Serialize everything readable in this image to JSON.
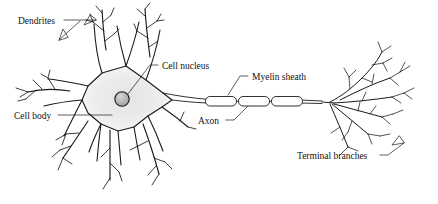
{
  "diagram": {
    "background_color": "#ffffff",
    "stroke_color": "#1a1a1a",
    "soma_fill_color": "#efefef",
    "nucleus_fill_color": "#b9b9b9",
    "labels": {
      "dendrites": "Dendrites",
      "cell_nucleus": "Cell nucleus",
      "cell_body": "Cell body",
      "myelin_sheath": "Myelin sheath",
      "axon": "Axon",
      "terminal_branches": "Terminal branches"
    },
    "parts": [
      {
        "name": "dendrites",
        "label": "Dendrites"
      },
      {
        "name": "cell-nucleus",
        "label": "Cell nucleus"
      },
      {
        "name": "cell-body",
        "label": "Cell body"
      },
      {
        "name": "myelin-sheath",
        "label": "Myelin sheath"
      },
      {
        "name": "axon",
        "label": "Axon"
      },
      {
        "name": "terminal-branches",
        "label": "Terminal branches"
      }
    ],
    "myelin_segment_count": 3
  }
}
